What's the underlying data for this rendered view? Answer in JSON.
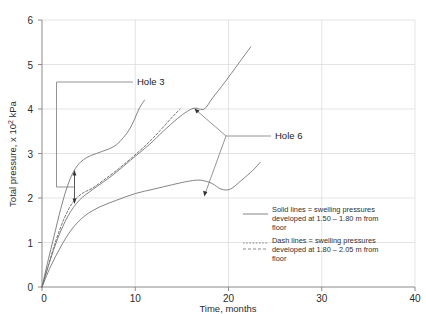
{
  "chart_data": {
    "type": "line",
    "title": "",
    "xlabel": "Time, months",
    "ylabel": "Total pressure, x 10",
    "ylabel_sup": "2",
    "ylabel_unit": " kPa",
    "xlim": [
      0,
      40
    ],
    "ylim": [
      0,
      6
    ],
    "xticks": [
      "0",
      "10",
      "20",
      "30",
      "40"
    ],
    "yticks": [
      "0",
      "1",
      "2",
      "3",
      "4",
      "5",
      "6"
    ],
    "grid": true,
    "legend_position": "bottom-right",
    "series": [
      {
        "name": "Hole 3 solid",
        "style": "solid",
        "label": "Hole 3",
        "points": [
          [
            0,
            0
          ],
          [
            0.6,
            0.55
          ],
          [
            1.3,
            1.15
          ],
          [
            2.0,
            1.75
          ],
          [
            2.7,
            2.25
          ],
          [
            3.4,
            2.6
          ],
          [
            4.2,
            2.82
          ],
          [
            5.2,
            2.95
          ],
          [
            6.5,
            3.05
          ],
          [
            8.0,
            3.2
          ],
          [
            9.4,
            3.55
          ],
          [
            10.4,
            4.0
          ],
          [
            11.0,
            4.2
          ]
        ]
      },
      {
        "name": "Hole 3 dash",
        "style": "dash",
        "label": "Hole 3",
        "points": [
          [
            0,
            0
          ],
          [
            0.7,
            0.5
          ],
          [
            1.5,
            1.05
          ],
          [
            2.4,
            1.55
          ],
          [
            3.3,
            1.9
          ],
          [
            4.3,
            2.1
          ],
          [
            5.4,
            2.22
          ],
          [
            6.6,
            2.4
          ],
          [
            8.0,
            2.62
          ],
          [
            9.6,
            2.9
          ],
          [
            11.2,
            3.2
          ],
          [
            12.6,
            3.5
          ],
          [
            13.8,
            3.78
          ],
          [
            14.8,
            4.0
          ]
        ]
      },
      {
        "name": "Hole 6 solid upper",
        "style": "solid",
        "label": "Hole 6",
        "points": [
          [
            0,
            0
          ],
          [
            0.8,
            0.55
          ],
          [
            1.7,
            1.1
          ],
          [
            2.8,
            1.6
          ],
          [
            4.0,
            1.95
          ],
          [
            5.5,
            2.2
          ],
          [
            7.5,
            2.5
          ],
          [
            9.5,
            2.85
          ],
          [
            11.5,
            3.2
          ],
          [
            13.0,
            3.5
          ],
          [
            14.5,
            3.78
          ],
          [
            15.6,
            3.95
          ],
          [
            16.4,
            4.02
          ],
          [
            17.4,
            4.0
          ],
          [
            18.3,
            4.25
          ],
          [
            19.6,
            4.6
          ],
          [
            21.0,
            5.0
          ],
          [
            22.4,
            5.4
          ]
        ]
      },
      {
        "name": "Hole 6 solid lower",
        "style": "solid",
        "label": "Hole 6",
        "points": [
          [
            0,
            0
          ],
          [
            0.9,
            0.45
          ],
          [
            2.0,
            0.9
          ],
          [
            3.2,
            1.3
          ],
          [
            4.6,
            1.6
          ],
          [
            6.2,
            1.8
          ],
          [
            8.0,
            1.95
          ],
          [
            10.0,
            2.1
          ],
          [
            12.0,
            2.2
          ],
          [
            14.0,
            2.3
          ],
          [
            15.8,
            2.38
          ],
          [
            17.0,
            2.4
          ],
          [
            18.2,
            2.33
          ],
          [
            19.2,
            2.2
          ],
          [
            20.2,
            2.2
          ],
          [
            21.4,
            2.4
          ],
          [
            22.6,
            2.62
          ],
          [
            23.4,
            2.8
          ]
        ]
      }
    ],
    "annotations": [
      {
        "name": "hole-3",
        "text": "Hole 3"
      },
      {
        "name": "hole-6",
        "text": "Hole 6"
      }
    ],
    "legend": [
      {
        "style": "solid",
        "line1": "Solid lines = swelling pressures",
        "line2": "developed at 1.50 – 1.80 m from",
        "line3": "floor"
      },
      {
        "style": "dash",
        "line1": "Dash lines = swelling pressures",
        "line2": "developed at 1.80 – 2.05 m from",
        "line3": "floor"
      }
    ]
  }
}
